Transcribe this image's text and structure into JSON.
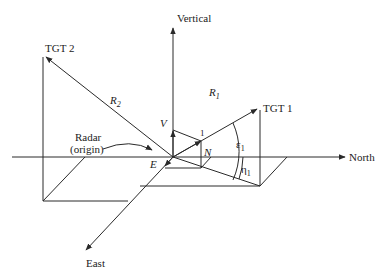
{
  "figure": {
    "type": "radar coordinate geometry diagram",
    "axes": {
      "north": "North",
      "vertical": "Vertical",
      "east": "East"
    },
    "origin_label": {
      "line1": "Radar",
      "line2": "(origin)"
    },
    "targets": [
      {
        "label": "TGT 1",
        "range_symbol": "R",
        "range_sub": "1"
      },
      {
        "label": "TGT 2",
        "range_symbol": "R",
        "range_sub": "2"
      }
    ],
    "components": {
      "east": "E",
      "north": "N",
      "vertical": "V",
      "unit_marker": "1"
    },
    "angles": {
      "elevation": {
        "symbol": "ε",
        "sub": "1"
      },
      "azimuth": {
        "symbol": "η",
        "sub": "1"
      }
    },
    "colors": {
      "line": "#2a2a2a",
      "text": "#222222",
      "background": "#ffffff"
    }
  }
}
